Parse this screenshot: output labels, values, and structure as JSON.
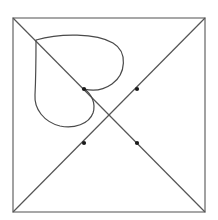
{
  "figure": {
    "canvas": {
      "width": 218,
      "height": 220,
      "background": "#ffffff"
    },
    "colors": {
      "frame_stroke": "#8a8a8a",
      "diagonal_stroke": "#555555",
      "curve_stroke": "#4a4a4a",
      "marker_fill": "#1a1a1a"
    },
    "strokes": {
      "frame_width": 1.6,
      "diagonal_width": 1.2,
      "curve_width": 1.2
    },
    "square": {
      "label": "bounding-square",
      "left": 13,
      "top": 18,
      "right": 205,
      "bottom": 212,
      "path": "M 13 18 L 205 18 L 205 212 L 13 212 Z"
    },
    "diagonals": [
      {
        "label": "diagonal-top-left-to-bottom-right",
        "x1": 13,
        "y1": 18,
        "x2": 205,
        "y2": 212,
        "path": "M 13 18 L 205 212"
      },
      {
        "label": "diagonal-top-right-to-bottom-left",
        "x1": 205,
        "y1": 18,
        "x2": 13,
        "y2": 212,
        "path": "M 205 18 L 13 212"
      }
    ],
    "center_point": {
      "x": 109,
      "y": 115
    },
    "heart_curve": {
      "label": "heart-shaped-closed-curve",
      "top_cusp": {
        "x": 36,
        "y": 40
      },
      "inner_cusp": {
        "x": 84,
        "y": 89
      },
      "right_lobe_extent_x": 123,
      "lower_lobe_bottom_y": 126,
      "lower_lobe_left_x": 35,
      "path": "M 36 40 C 60 33 96 33 113 43 C 128 52 126 74 112 84 C 102 91 92 91 84 89 C 92 94 96 104 93 113 C 89 124 74 129 60 126 C 44 122 34 109 35 95 C 36 74 36 52 36 40 Z"
    },
    "markers": [
      {
        "label": "marker-upper-left",
        "x": 84,
        "y": 89,
        "radius": 2.1
      },
      {
        "label": "marker-upper-right",
        "x": 137,
        "y": 89,
        "radius": 2.1
      },
      {
        "label": "marker-lower-left",
        "x": 84,
        "y": 143,
        "radius": 2.1
      },
      {
        "label": "marker-lower-right",
        "x": 137,
        "y": 143,
        "radius": 2.1
      }
    ]
  }
}
